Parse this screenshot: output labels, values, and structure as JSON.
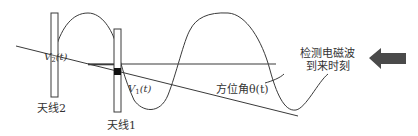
{
  "diagram": {
    "antenna2_label": "天线2",
    "antenna1_label": "天线1",
    "signal2_label_main": "V",
    "signal2_label_sub": "2",
    "signal2_label_arg": "(t)",
    "signal1_label_main": "V",
    "signal1_label_sub": "1",
    "signal1_label_arg": "(t)",
    "azimuth_label": "方位角θ(t)",
    "detect_line1": "检测电磁波",
    "detect_line2": "到来时刻",
    "arrow_icon": "left-arrow",
    "colors": {
      "stroke": "#3a3a3a",
      "arrow_fill": "#4a4a4a",
      "text": "#333333"
    }
  }
}
